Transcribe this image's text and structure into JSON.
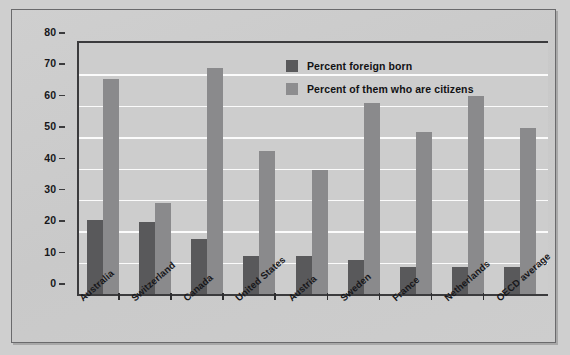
{
  "chart_data": {
    "type": "bar",
    "title": "",
    "subtitle": "",
    "xlabel": "",
    "ylabel": "",
    "ylim": [
      0,
      80
    ],
    "ytick_step": 10,
    "ytick_labels": [
      "0",
      "10",
      "20",
      "30",
      "40",
      "50",
      "60",
      "70",
      "80"
    ],
    "grid": "horizontal",
    "legend_position": "inside-top-center",
    "categories": [
      "Australia",
      "Switzerland",
      "Canada",
      "United States",
      "Austria",
      "Sweden",
      "France",
      "Netherlands",
      "OECD average"
    ],
    "series": [
      {
        "name": "Percent foreign born",
        "color": "#59595b",
        "values": [
          23.5,
          23,
          17.5,
          12,
          12,
          11,
          8.5,
          8.5,
          8.5
        ]
      },
      {
        "name": "Percent of them who are citizens",
        "color": "#8a8a8c",
        "values": [
          68.5,
          29,
          72,
          45.5,
          39.5,
          61,
          51.5,
          63,
          53
        ]
      }
    ]
  },
  "legend": {
    "entries": [
      {
        "label": "Percent foreign born",
        "swatch": "dark"
      },
      {
        "label": "Percent of them who are citizens",
        "swatch": "light"
      }
    ]
  },
  "colors": {
    "series_dark": "#59595b",
    "series_light": "#8a8a8c",
    "plot_background": "#cdcdcd",
    "gridline": "#fbfbfb",
    "axis": "#3b3b3d",
    "frame": "#6a6a6c",
    "text": "#17171a"
  }
}
